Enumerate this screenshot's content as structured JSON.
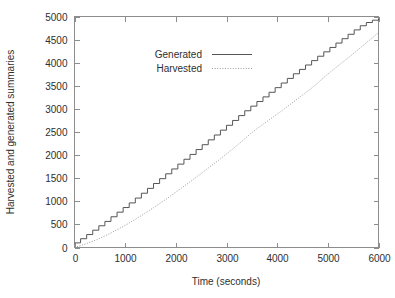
{
  "chart_data": {
    "type": "line",
    "title": "",
    "xlabel": "Time (seconds)",
    "ylabel": "Harvested and generated summaries",
    "xlim": [
      0,
      6000
    ],
    "ylim": [
      0,
      5000
    ],
    "xticks": [
      0,
      1000,
      2000,
      3000,
      4000,
      5000,
      6000
    ],
    "yticks": [
      0,
      500,
      1000,
      1500,
      2000,
      2500,
      3000,
      3500,
      4000,
      4500,
      5000
    ],
    "xtick_labels": [
      "0",
      "1000",
      "2000",
      "3000",
      "4000",
      "5000",
      "6000"
    ],
    "ytick_labels": [
      "0",
      "500",
      "1000",
      "1500",
      "2000",
      "2500",
      "3000",
      "3500",
      "4000",
      "4500",
      "5000"
    ],
    "grid": false,
    "legend_position": "upper-left-inside",
    "series": [
      {
        "name": "Generated",
        "style": "solid-step",
        "color": "#555555",
        "x": [
          0,
          120,
          240,
          360,
          480,
          600,
          720,
          840,
          960,
          1080,
          1200,
          1320,
          1440,
          1560,
          1680,
          1800,
          1920,
          2040,
          2160,
          2280,
          2400,
          2520,
          2640,
          2760,
          2880,
          3000,
          3120,
          3240,
          3360,
          3480,
          3600,
          3720,
          3840,
          3960,
          4080,
          4200,
          4320,
          4440,
          4560,
          4680,
          4800,
          4920,
          5040,
          5160,
          5280,
          5400,
          5520,
          5640,
          5760,
          5880,
          6000
        ],
        "values": [
          100,
          190,
          280,
          375,
          470,
          565,
          665,
          765,
          865,
          965,
          1070,
          1175,
          1280,
          1385,
          1490,
          1595,
          1700,
          1805,
          1910,
          2015,
          2120,
          2225,
          2330,
          2435,
          2540,
          2645,
          2750,
          2855,
          2960,
          3060,
          3160,
          3260,
          3360,
          3460,
          3560,
          3660,
          3760,
          3855,
          3950,
          4045,
          4140,
          4235,
          4330,
          4425,
          4520,
          4615,
          4710,
          4800,
          4870,
          4920,
          4950
        ]
      },
      {
        "name": "Harvested",
        "style": "dotted-smooth",
        "color": "#9a9a9a",
        "x": [
          0,
          120,
          240,
          360,
          480,
          600,
          720,
          840,
          960,
          1080,
          1200,
          1320,
          1440,
          1560,
          1680,
          1800,
          1920,
          2040,
          2160,
          2280,
          2400,
          2520,
          2640,
          2760,
          2880,
          3000,
          3120,
          3240,
          3360,
          3480,
          3600,
          3720,
          3840,
          3960,
          4080,
          4200,
          4320,
          4440,
          4560,
          4680,
          4800,
          4920,
          5040,
          5160,
          5280,
          5400,
          5520,
          5640,
          5760,
          5880,
          6000
        ],
        "values": [
          0,
          40,
          85,
          135,
          190,
          250,
          315,
          385,
          455,
          530,
          610,
          690,
          775,
          860,
          950,
          1040,
          1135,
          1230,
          1325,
          1420,
          1520,
          1620,
          1720,
          1820,
          1920,
          2025,
          2130,
          2240,
          2355,
          2470,
          2570,
          2665,
          2760,
          2855,
          2950,
          3050,
          3150,
          3250,
          3350,
          3450,
          3560,
          3680,
          3790,
          3895,
          4000,
          4105,
          4210,
          4320,
          4430,
          4540,
          4650
        ]
      }
    ]
  },
  "legend": {
    "items": [
      {
        "label": "Generated",
        "style": "solid"
      },
      {
        "label": "Harvested",
        "style": "dotted"
      }
    ]
  }
}
